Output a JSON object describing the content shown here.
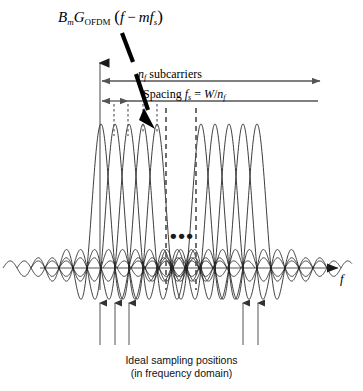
{
  "figure": {
    "title_formula": {
      "b": "B",
      "b_sub": "m",
      "g": "G",
      "g_sub": "OFDM",
      "open_paren": "(",
      "f1": "f",
      "minus": "−",
      "m": "m",
      "f2": "f",
      "f2_sub": "s",
      "close_paren": ")",
      "plain": "Bm GOFDM (f − mfs)"
    },
    "annotations": {
      "subcarriers_n": "n",
      "subcarriers_n_sub": "f",
      "subcarriers_word": " subcarriers",
      "spacing_word": "Spacing ",
      "spacing_f": "f",
      "spacing_f_sub": "s",
      "spacing_eq": " = ",
      "spacing_w": "W",
      "spacing_slash": "/",
      "spacing_n": "n",
      "spacing_n_sub": "f",
      "subcarriers_plain": "nf subcarriers",
      "spacing_plain": "Spacing fs = W/nf"
    },
    "axis": {
      "x_label": "f",
      "y_label": ""
    },
    "ellipsis": "•••",
    "caption": {
      "line1": "Ideal sampling positions",
      "line2": "(in frequency domain)"
    },
    "colors": {
      "curve": "#1a1a1a",
      "axis": "#7a7a7a",
      "dashed": "#4d4d4d",
      "arrow": "#8a8a8a",
      "pointer": "#000000",
      "background": "#ffffff"
    }
  },
  "chart_data": {
    "type": "line",
    "xlabel": "f",
    "ylabel": "",
    "baseline_y": 268,
    "peak_top_y": 124,
    "spacing_px": 14,
    "left_group": {
      "peak_x": [
        101,
        115,
        129,
        143,
        157
      ],
      "count": 5
    },
    "right_group": {
      "peak_x": [
        201,
        215,
        229,
        243,
        257
      ],
      "count": 5
    },
    "sampling_arrows_x": [
      100,
      115,
      129,
      243,
      258
    ],
    "dashed_vertical_x": [
      166,
      196
    ],
    "dotted_short_x": [
      114,
      128,
      143,
      157
    ],
    "axis_origin_x": 100,
    "axis_x_end": 345,
    "axis_y_top": 60,
    "grid": false,
    "legend": "none"
  }
}
